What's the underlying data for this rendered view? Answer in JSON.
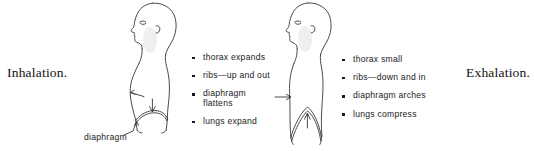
{
  "figure": {
    "title_left": "Inhalation.",
    "title_right": "Exhalation.",
    "label_diaphragm": "diaphragm",
    "ink_color": "#2b2b2b",
    "background_color": "#ffffff"
  },
  "inhalation": {
    "caption": "Inhalation.",
    "bullets": [
      {
        "text": "thorax expands"
      },
      {
        "text": "ribs—up and out"
      },
      {
        "text": "diaphragm",
        "text2": "flattens"
      },
      {
        "text": "lungs expand"
      }
    ]
  },
  "exhalation": {
    "caption": "Exhalation.",
    "bullets": [
      {
        "text": "thorax small"
      },
      {
        "text": "ribs—down and in"
      },
      {
        "text": "diaphragm arches"
      },
      {
        "text": "lungs compress"
      }
    ]
  },
  "annotations": {
    "diaphragm_label": "diaphragm"
  }
}
